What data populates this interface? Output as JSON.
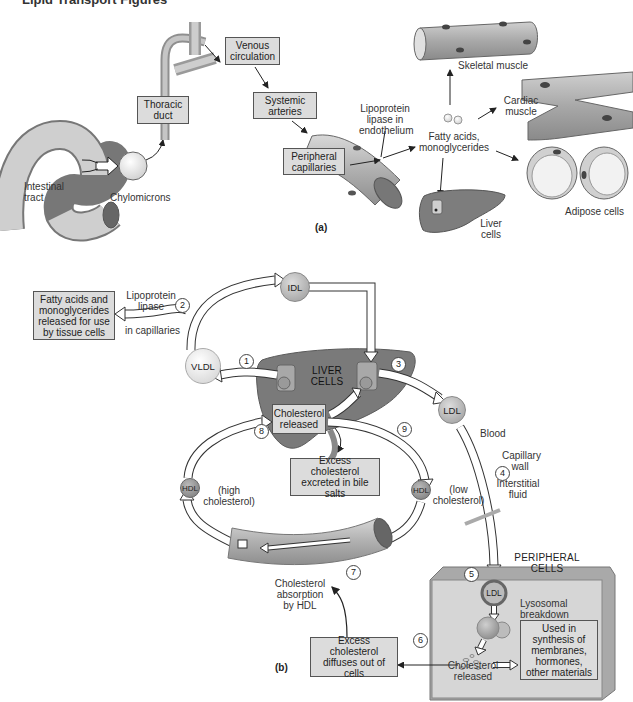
{
  "header": {
    "title": "Lipid Transport Figures"
  },
  "colors": {
    "box_fill": "#dcdcdc",
    "box_border": "#555555",
    "liver": "#7a7a7a",
    "vessel": "#b5b5b5",
    "peripheral_cell": "#d0d0d0",
    "lipoprotein_light": "#e6e6e6",
    "lipoprotein_dark": "#9c9c9c"
  },
  "part_a": {
    "label": "(a)",
    "intestinal_tract": "Intestinal tract",
    "chylomicrons": "Chylomicrons",
    "thoracic_duct": "Thoracic duct",
    "venous_circulation": "Venous circulation",
    "systemic_arteries": "Systemic arteries",
    "peripheral_capillaries": "Peripheral capillaries",
    "lipoprotein_lipase": "Lipoprotein lipase in endothelium",
    "fatty_acids": "Fatty acids, monoglycerides",
    "skeletal_muscle": "Skeletal muscle",
    "cardiac_muscle": "Cardiac muscle",
    "adipose_cells": "Adipose cells",
    "liver_cells": "Liver cells"
  },
  "part_b": {
    "label": "(b)",
    "fatty_acids_box": "Fatty acids and monoglycerides released for use by tissue cells",
    "lipoprotein_lipase": "Lipoprotein lipase",
    "in_capillaries": "in capillaries",
    "idl": "IDL",
    "vldl": "VLDL",
    "liver_cells": "LIVER CELLS",
    "cholesterol_released_liver": "Cholesterol released",
    "excess_excreted": "Excess cholesterol excreted in bile salts",
    "ldl": "LDL",
    "blood": "Blood",
    "capillary_wall": "Capillary wall",
    "interstitial_fluid": "Interstitial fluid",
    "hdl": "HDL",
    "high_cholesterol": "(high cholesterol)",
    "low_cholesterol": "(low cholesterol)",
    "peripheral_cells": "PERIPHERAL CELLS",
    "lysosomal_breakdown": "Lysosomal breakdown",
    "cholesterol_released_cell": "Cholesterol released",
    "used_in_synthesis": "Used in synthesis of membranes, hormones, other materials",
    "cholesterol_absorption": "Cholesterol absorption by HDL",
    "excess_diffuses": "Excess cholesterol diffuses out of cells",
    "steps": [
      "1",
      "2",
      "3",
      "4",
      "5",
      "6",
      "7",
      "8",
      "9"
    ]
  }
}
